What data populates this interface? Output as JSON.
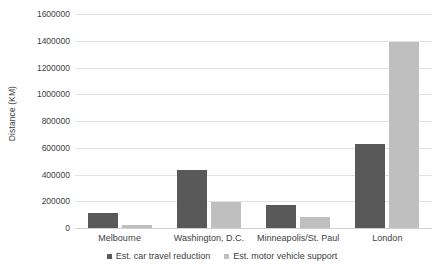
{
  "chart_data": {
    "type": "bar",
    "title": "",
    "xlabel": "",
    "ylabel": "Distance (KM)",
    "categories": [
      "Melbourne",
      "Washington, D.C.",
      "Minneapolis/St. Paul",
      "London"
    ],
    "series": [
      {
        "name": "Est. car travel reduction",
        "color": "#595959",
        "values": [
          110000,
          435000,
          175000,
          625000
        ]
      },
      {
        "name": "Est. motor vehicle support",
        "color": "#bfbfbf",
        "values": [
          25000,
          195000,
          80000,
          1390000
        ]
      }
    ],
    "ylim": [
      0,
      1600000
    ],
    "ytick_step": 200000,
    "ytick_labels": [
      "0",
      "200000",
      "400000",
      "600000",
      "800000",
      "1000000",
      "1200000",
      "1400000",
      "1600000"
    ],
    "ytick_values": [
      0,
      200000,
      400000,
      600000,
      800000,
      1000000,
      1200000,
      1400000,
      1600000
    ],
    "grid": true,
    "legend_position": "bottom"
  }
}
